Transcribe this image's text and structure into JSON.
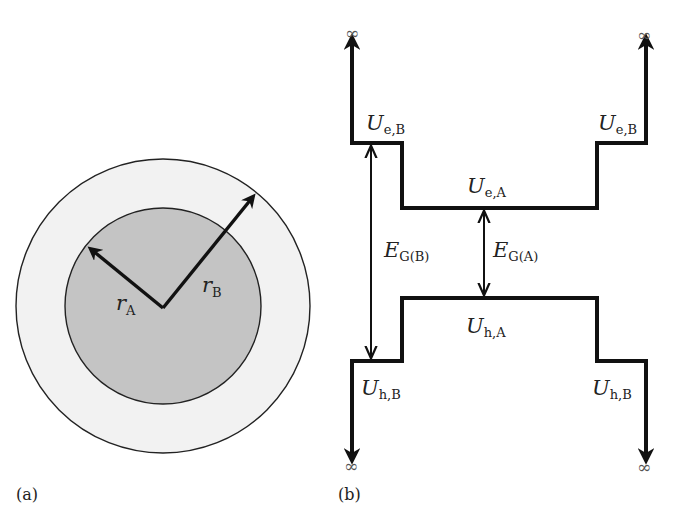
{
  "figure": {
    "panel_a": {
      "panel_label": "(a)",
      "outer_shell_label": "B",
      "core_label": "A",
      "radius_labels": [
        {
          "symbol": "r",
          "subscript": "A"
        },
        {
          "symbol": "r",
          "subscript": "B"
        }
      ],
      "colors": {
        "core_fill": "#c4c4c4",
        "shell_fill": "#f2f2f2",
        "outline": "#222222"
      }
    },
    "panel_b": {
      "panel_label": "(b)",
      "infinity_symbol": "∞",
      "levels": {
        "ue_b_left": {
          "symbol": "U",
          "subscript": "e,B"
        },
        "ue_b_right": {
          "symbol": "U",
          "subscript": "e,B"
        },
        "ue_a": {
          "symbol": "U",
          "subscript": "e,A"
        },
        "uh_a": {
          "symbol": "U",
          "subscript": "h,A"
        },
        "uh_b_left": {
          "symbol": "U",
          "subscript": "h,B"
        },
        "uh_b_right": {
          "symbol": "U",
          "subscript": "h,B"
        }
      },
      "gaps": {
        "eg_b": {
          "symbol": "E",
          "subscript": "G(B)"
        },
        "eg_a": {
          "symbol": "E",
          "subscript": "G(A)"
        }
      }
    }
  }
}
